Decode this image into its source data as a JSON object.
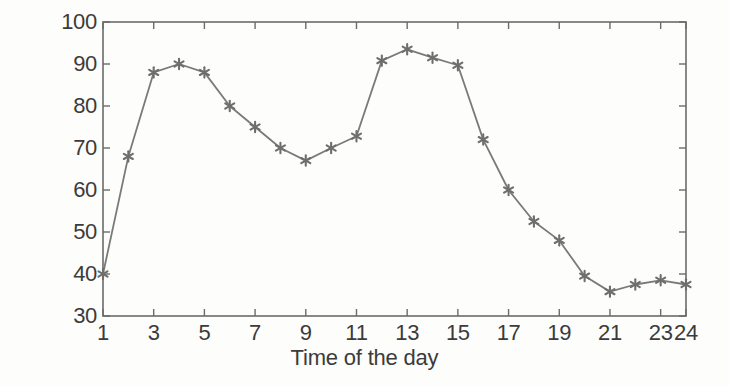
{
  "chart_data": {
    "type": "line",
    "title": "",
    "xlabel": "Time of the day",
    "ylabel": "WTDG Power Output (kW)",
    "xlim": [
      1,
      24
    ],
    "ylim": [
      30,
      100
    ],
    "grid": false,
    "legend": null,
    "line_color": "#7a7a7a",
    "marker": "asterisk",
    "marker_color": "#6e6e6e",
    "background_color": "#fdfdfb",
    "axis_color": "#6b6b6b",
    "text_color": "#3b3b3b",
    "x": [
      1,
      2,
      3,
      4,
      5,
      6,
      7,
      8,
      9,
      10,
      11,
      12,
      13,
      14,
      15,
      16,
      17,
      18,
      19,
      20,
      21,
      22,
      23,
      24
    ],
    "values": [
      40,
      68,
      88,
      90,
      88,
      80,
      75,
      70,
      67,
      70,
      72.8,
      90.8,
      93.5,
      91.5,
      89.7,
      72,
      60,
      52.5,
      48,
      39.5,
      35.8,
      37.5,
      38.5,
      37.5
    ],
    "series": [
      {
        "name": "WTDG Power Output",
        "values": [
          40,
          68,
          88,
          90,
          88,
          80,
          75,
          70,
          67,
          70,
          72.8,
          90.8,
          93.5,
          91.5,
          89.7,
          72,
          60,
          52.5,
          48,
          39.5,
          35.8,
          37.5,
          38.5,
          37.5
        ]
      }
    ],
    "xticks": [
      1,
      3,
      5,
      7,
      9,
      11,
      13,
      15,
      17,
      19,
      21,
      23,
      24
    ],
    "xtick_labels": [
      "1",
      "3",
      "5",
      "7",
      "9",
      "11",
      "13",
      "15",
      "17",
      "19",
      "21",
      "23",
      "24"
    ],
    "yticks": [
      30,
      40,
      50,
      60,
      70,
      80,
      90,
      100
    ],
    "ytick_labels": [
      "30",
      "40",
      "50",
      "60",
      "70",
      "80",
      "90",
      "100"
    ]
  }
}
